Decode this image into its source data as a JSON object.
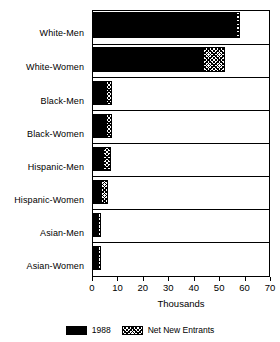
{
  "chart_data": {
    "type": "bar",
    "orientation": "horizontal",
    "stacked": true,
    "title": "",
    "xlabel": "Thousands",
    "ylabel": "",
    "xlim": [
      0,
      70
    ],
    "xticks": [
      0,
      10,
      20,
      30,
      40,
      50,
      60,
      70
    ],
    "xticklabels": [
      "0",
      "10",
      "20",
      "30",
      "40",
      "50",
      "60",
      "70"
    ],
    "grid": false,
    "legend_position": "bottom",
    "categories": [
      "White-Men",
      "White-Women",
      "Black-Men",
      "Black-Women",
      "Hispanic-Men",
      "Hispanic-Women",
      "Asian-Men",
      "Asian-Women"
    ],
    "series": [
      {
        "name": "1988",
        "fill": "solid-black",
        "color": "#000000",
        "values": [
          56.5,
          43.5,
          5.5,
          5.5,
          4.5,
          3.5,
          2.5,
          2.5
        ]
      },
      {
        "name": "Net New Entrants",
        "fill": "hatch",
        "color": "#000000",
        "values": [
          1.5,
          8.5,
          2.0,
          2.0,
          2.5,
          2.5,
          0.5,
          0.5
        ]
      }
    ],
    "totals": [
      58.0,
      52.0,
      7.5,
      7.5,
      7.0,
      6.0,
      3.0,
      3.0
    ]
  },
  "legend": {
    "items": [
      {
        "label": "1988",
        "swatch": "solid-swatch"
      },
      {
        "label": "Net New Entrants",
        "swatch": "hatch-swatch"
      }
    ]
  }
}
